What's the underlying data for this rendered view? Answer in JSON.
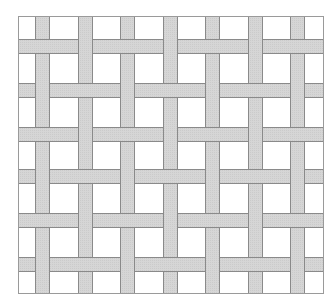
{
  "figure": {
    "frame": {
      "x": 18,
      "y": 16,
      "width": 305,
      "height": 277
    },
    "colors": {
      "background": "#ffffff",
      "strip_fill": "#d6d6d6",
      "strip_edge": "#8a8a8a",
      "frame": "#9a9a9a"
    },
    "strip_width": 15,
    "vertical_strips_x": [
      35,
      78,
      120,
      163,
      205,
      248,
      290
    ],
    "horizontal_strips_y": [
      39,
      83,
      127,
      169,
      213,
      257
    ],
    "over_pattern": {
      "note": "For each horizontal row, list which vertical strip indices pass OVER the horizontal strip",
      "rows": [
        [
          1,
          3,
          5
        ],
        [
          0,
          2,
          4,
          6
        ],
        [
          1,
          3,
          5
        ],
        [
          0,
          2,
          4,
          6
        ],
        [
          1,
          3,
          5
        ],
        [
          0,
          2,
          4,
          6
        ]
      ]
    }
  }
}
